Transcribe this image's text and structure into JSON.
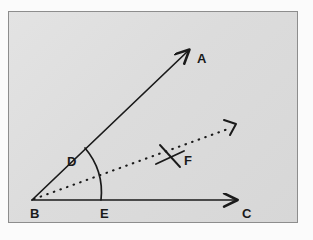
{
  "figure": {
    "kind": "geometry-diagram",
    "panel": {
      "background_color": "#dcdcdc",
      "border_color": "#8d8d8d",
      "x": 8,
      "y": 11,
      "width": 290,
      "height": 212
    },
    "ink_color": "#1a1a1a",
    "points": [
      {
        "id": "A",
        "label": "A",
        "x": 196,
        "y": 57,
        "role": "ray-endpoint-label"
      },
      {
        "id": "B",
        "label": "B",
        "x": 33,
        "y": 212,
        "role": "vertex-label"
      },
      {
        "id": "C",
        "label": "C",
        "x": 245,
        "y": 212,
        "role": "ray-endpoint-label"
      },
      {
        "id": "D",
        "label": "D",
        "x": 70,
        "y": 156,
        "role": "point-on-ray-BA-label"
      },
      {
        "id": "E",
        "label": "E",
        "x": 103,
        "y": 212,
        "role": "point-on-ray-BC-label"
      },
      {
        "id": "F",
        "label": "F",
        "x": 187,
        "y": 159,
        "role": "point-on-bisector-label"
      }
    ],
    "vertex": {
      "x": 31,
      "y": 199
    },
    "rays": [
      {
        "id": "BA",
        "style": "solid",
        "from": "B",
        "to": "A",
        "arrowhead": true,
        "tip_x": 190,
        "tip_y": 45
      },
      {
        "id": "BC",
        "style": "solid",
        "from": "B",
        "to": "C",
        "arrowhead": true,
        "tip_x": 240,
        "tip_y": 199
      },
      {
        "id": "BF",
        "style": "dotted",
        "from": "B",
        "to": "F",
        "arrowhead": true,
        "tip_x": 236,
        "tip_y": 123
      }
    ],
    "arc": {
      "center": "B",
      "radius": 69,
      "from_ray": "BA",
      "to_ray": "BC"
    },
    "cross_mark": {
      "x": 170,
      "y": 155,
      "arm": 12,
      "on_ray": "BF"
    },
    "showthrough_lines": [
      {
        "text": "this pag",
        "x": 18,
        "y": 52,
        "size": 10,
        "rotate": 0
      },
      {
        "text": "have an ang",
        "x": 74,
        "y": 50,
        "size": 10,
        "rotate": 0
      },
      {
        "text": "be state",
        "x": 24,
        "y": 70,
        "size": 9,
        "rotate": 0
      },
      {
        "text": "angle",
        "x": 20,
        "y": 118,
        "size": 9,
        "rotate": 0
      },
      {
        "text": "line",
        "x": 22,
        "y": 166,
        "size": 9,
        "rotate": 0
      }
    ]
  }
}
